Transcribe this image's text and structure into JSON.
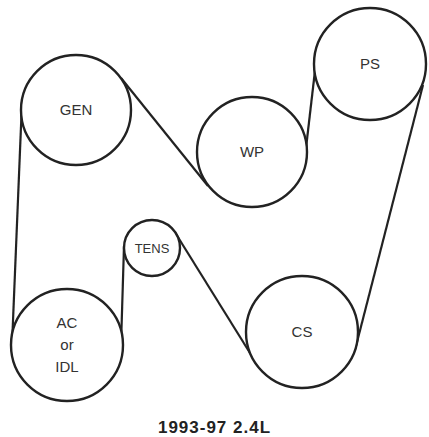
{
  "diagram": {
    "colors": {
      "stroke": "#222222",
      "text": "#333333",
      "background": "#ffffff"
    },
    "pulleys": [
      {
        "id": "gen",
        "label": "GEN",
        "cx": 76,
        "cy": 110,
        "r": 55
      },
      {
        "id": "wp",
        "label": "WP",
        "cx": 252,
        "cy": 152,
        "r": 55
      },
      {
        "id": "ps",
        "label": "PS",
        "cx": 370,
        "cy": 64,
        "r": 56
      },
      {
        "id": "tens",
        "label": "TENS",
        "cx": 152,
        "cy": 248,
        "r": 28
      },
      {
        "id": "ac",
        "label_lines": [
          "AC",
          "or",
          "IDL"
        ],
        "cx": 67,
        "cy": 345,
        "r": 56
      },
      {
        "id": "cs",
        "label": "CS",
        "cx": 302,
        "cy": 332,
        "r": 56
      }
    ],
    "belt_segments": [
      {
        "from": "gen",
        "to": "wp",
        "x1": 121,
        "y1": 78,
        "x2": 208,
        "y2": 186
      },
      {
        "from": "wp",
        "to": "ps",
        "x1": 306,
        "y1": 148,
        "x2": 316,
        "y2": 62
      },
      {
        "from": "ps",
        "to": "cs",
        "x1": 423,
        "y1": 85,
        "x2": 356,
        "y2": 346
      },
      {
        "from": "cs",
        "to": "tens",
        "x1": 250,
        "y1": 353,
        "x2": 176,
        "y2": 234
      },
      {
        "from": "tens",
        "to": "ac",
        "x1": 124,
        "y1": 246,
        "x2": 121,
        "y2": 345
      },
      {
        "from": "ac",
        "to": "gen",
        "x1": 12,
        "y1": 345,
        "x2": 22,
        "y2": 102
      }
    ],
    "caption": "1993-97 2.4L"
  }
}
